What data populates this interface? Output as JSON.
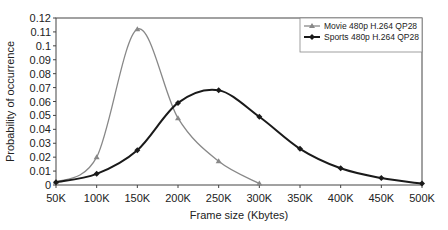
{
  "chart_data": {
    "type": "line",
    "title": "",
    "xlabel": "Frame size (Kbytes)",
    "ylabel": "Probability of occurrence",
    "categories": [
      "50K",
      "100K",
      "150K",
      "200K",
      "250K",
      "300K",
      "350K",
      "400K",
      "450K",
      "500K"
    ],
    "yticks": [
      "0",
      "0.01",
      "0.02",
      "0.03",
      "0.04",
      "0.05",
      "0.06",
      "0.07",
      "0.08",
      "0.09",
      "0.1",
      "0.11",
      "0.12"
    ],
    "ylim": [
      0,
      0.12
    ],
    "grid": false,
    "legend_position": "top-right",
    "series": [
      {
        "name": "Movie 480p H.264 QP28",
        "marker": "triangle",
        "color": "#888888",
        "values": [
          0.002,
          0.02,
          0.112,
          0.048,
          0.017,
          0.001,
          null,
          null,
          null,
          null
        ]
      },
      {
        "name": "Sports 480p H.264 QP28",
        "marker": "diamond",
        "color": "#1a1a1a",
        "values": [
          0.002,
          0.008,
          0.025,
          0.059,
          0.068,
          0.049,
          0.026,
          0.012,
          0.005,
          0.001
        ]
      }
    ]
  }
}
